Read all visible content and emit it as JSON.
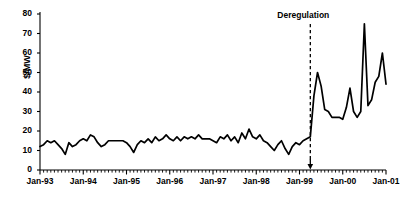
{
  "chart_data": {
    "type": "line",
    "title": "",
    "subtitle": "",
    "xlabel": "",
    "ylabel": "$/MW",
    "ylim": [
      0,
      80
    ],
    "yticks": [
      0,
      10,
      20,
      30,
      40,
      50,
      60,
      70,
      80
    ],
    "xlim": [
      "Jan-93",
      "Jan-01"
    ],
    "xticks": [
      "Jan-93",
      "Jan-94",
      "Jan-95",
      "Jan-96",
      "Jan-97",
      "Jan-98",
      "Jan-99",
      "Jan-00",
      "Jan-01"
    ],
    "grid": false,
    "legend": null,
    "minor_ticks": "monthly",
    "line_color": "#000000",
    "annotations": [
      {
        "text": "Deregulation",
        "x": "Apr-99",
        "style": "dashed-vertical-line-with-down-arrow"
      }
    ],
    "x": [
      "Jan-93",
      "Feb-93",
      "Mar-93",
      "Apr-93",
      "May-93",
      "Jun-93",
      "Jul-93",
      "Aug-93",
      "Sep-93",
      "Oct-93",
      "Nov-93",
      "Dec-93",
      "Jan-94",
      "Feb-94",
      "Mar-94",
      "Apr-94",
      "May-94",
      "Jun-94",
      "Jul-94",
      "Aug-94",
      "Sep-94",
      "Oct-94",
      "Nov-94",
      "Dec-94",
      "Jan-95",
      "Feb-95",
      "Mar-95",
      "Apr-95",
      "May-95",
      "Jun-95",
      "Jul-95",
      "Aug-95",
      "Sep-95",
      "Oct-95",
      "Nov-95",
      "Dec-95",
      "Jan-96",
      "Feb-96",
      "Mar-96",
      "Apr-96",
      "May-96",
      "Jun-96",
      "Jul-96",
      "Aug-96",
      "Sep-96",
      "Oct-96",
      "Nov-96",
      "Dec-96",
      "Jan-97",
      "Feb-97",
      "Mar-97",
      "Apr-97",
      "May-97",
      "Jun-97",
      "Jul-97",
      "Aug-97",
      "Sep-97",
      "Oct-97",
      "Nov-97",
      "Dec-97",
      "Jan-98",
      "Feb-98",
      "Mar-98",
      "Apr-98",
      "May-98",
      "Jun-98",
      "Jul-98",
      "Aug-98",
      "Sep-98",
      "Oct-98",
      "Nov-98",
      "Dec-98",
      "Jan-99",
      "Feb-99",
      "Mar-99",
      "Apr-99",
      "May-99",
      "Jun-99",
      "Jul-99",
      "Aug-99",
      "Sep-99",
      "Oct-99",
      "Nov-99",
      "Dec-99",
      "Jan-00",
      "Feb-00",
      "Mar-00",
      "Apr-00",
      "May-00",
      "Jun-00",
      "Jul-00",
      "Aug-00",
      "Sep-00",
      "Oct-00",
      "Nov-00",
      "Dec-00",
      "Jan-01"
    ],
    "values": [
      12,
      13,
      15,
      14,
      15,
      13,
      11,
      8,
      14,
      12,
      13,
      15,
      16,
      15,
      18,
      17,
      14,
      12,
      13,
      15,
      15,
      15,
      15,
      15,
      14,
      12,
      9,
      13,
      15,
      14,
      16,
      14,
      17,
      15,
      16,
      18,
      16,
      15,
      17,
      15,
      17,
      16,
      17,
      16,
      18,
      16,
      16,
      16,
      15,
      14,
      17,
      16,
      18,
      15,
      17,
      14,
      19,
      16,
      21,
      17,
      16,
      18,
      15,
      14,
      12,
      10,
      13,
      15,
      11,
      8,
      12,
      14,
      13,
      15,
      16,
      17,
      38,
      50,
      43,
      31,
      30,
      27,
      27,
      27,
      26,
      32,
      42,
      30,
      27,
      30,
      75,
      33,
      36,
      45,
      48,
      60,
      44
    ]
  }
}
